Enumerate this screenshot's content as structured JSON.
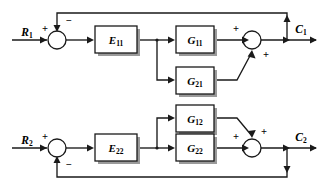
{
  "figure": {
    "type": "control-system-block-diagram",
    "background_color": "#ffffff",
    "line_color": "#1a1a1a",
    "block_fill": "#ffffff"
  },
  "inputs": [
    {
      "id": "r1",
      "base": "R",
      "sub": "1",
      "x": 27,
      "y": 33
    },
    {
      "id": "r2",
      "base": "R",
      "sub": "2",
      "x": 27,
      "y": 141
    }
  ],
  "outputs": [
    {
      "id": "c1",
      "base": "C",
      "sub": "1",
      "x": 301,
      "y": 30
    },
    {
      "id": "c2",
      "base": "C",
      "sub": "2",
      "x": 301,
      "y": 138
    }
  ],
  "blocks": [
    {
      "id": "e11",
      "base": "E",
      "sub": "11",
      "x": 95,
      "y": 26,
      "w": 42,
      "h": 27
    },
    {
      "id": "e22",
      "base": "E",
      "sub": "22",
      "x": 95,
      "y": 134,
      "w": 42,
      "h": 27
    },
    {
      "id": "g11",
      "base": "G",
      "sub": "11",
      "x": 176,
      "y": 26,
      "w": 38,
      "h": 27
    },
    {
      "id": "g21",
      "base": "G",
      "sub": "21",
      "x": 176,
      "y": 67,
      "w": 38,
      "h": 27
    },
    {
      "id": "g12",
      "base": "G",
      "sub": "12",
      "x": 176,
      "y": 105,
      "w": 38,
      "h": 27
    },
    {
      "id": "g22",
      "base": "G",
      "sub": "22",
      "x": 176,
      "y": 134,
      "w": 38,
      "h": 27
    }
  ],
  "summing_junctions": [
    {
      "id": "sum-r1",
      "cx": 57,
      "cy": 40,
      "r": 9,
      "signs": [
        {
          "label": "+",
          "x": 45,
          "y": 30,
          "port": "left"
        },
        {
          "label": "−",
          "x": 68,
          "y": 22,
          "port": "top"
        }
      ]
    },
    {
      "id": "sum-c1",
      "cx": 252,
      "cy": 40,
      "r": 9,
      "signs": [
        {
          "label": "+",
          "x": 236,
          "y": 30,
          "port": "left"
        },
        {
          "label": "+",
          "x": 265,
          "y": 56,
          "port": "bottom"
        }
      ]
    },
    {
      "id": "sum-r2",
      "cx": 57,
      "cy": 148,
      "r": 9,
      "signs": [
        {
          "label": "+",
          "x": 45,
          "y": 138,
          "port": "left"
        },
        {
          "label": "−",
          "x": 68,
          "y": 166,
          "port": "bottom"
        }
      ]
    },
    {
      "id": "sum-c2",
      "cx": 252,
      "cy": 148,
      "r": 9,
      "signs": [
        {
          "label": "+",
          "x": 236,
          "y": 138,
          "port": "left"
        },
        {
          "label": "+",
          "x": 263,
          "y": 133,
          "port": "top"
        }
      ]
    }
  ],
  "wires": {
    "r1_to_sum": "M 12,40 L 47,40",
    "sum_to_e11": "M 66,40 L 92,40",
    "e11_to_branch": "M 137,40 L 157,40",
    "branch_down": "M 157,40 L 157,80 L 173,80",
    "branch_to_g11": "M 157,40 L 173,40",
    "g11_to_sum": "M 214,40 L 249,40",
    "sum_to_c1": "M 261,40 L 316,40",
    "c1_feedback_up": "M 287,40 L 287,13 L 57,13 L 57,30",
    "r2_to_sum": "M 12,148 L 47,148",
    "sum_to_e22": "M 66,148 L 92,148",
    "e22_to_branch": "M 137,148 L 157,148",
    "branch_up_g12": "M 157,148 L 157,118 L 173,118",
    "branch_to_g22": "M 157,148 L 173,148",
    "g22_to_sum": "M 214,148 L 249,148",
    "sum_to_c2": "M 261,148 L 316,148",
    "c2_feedback_down": "M 287,148 L 287,177 L 57,177 L 57,158",
    "g21_cross": "M 214,80 L 237,80 L 252,52",
    "g12_cross": "M 214,118 L 237,118 L 252,136"
  },
  "junction_dots": [
    {
      "id": "tap-e11",
      "cx": 157,
      "cy": 40
    },
    {
      "id": "tap-e22",
      "cx": 157,
      "cy": 148
    }
  ],
  "arrowheads": [
    {
      "id": "arrow-r1-in",
      "x": 47,
      "y": 40,
      "dir": "right"
    },
    {
      "id": "arrow-e11-in",
      "x": 93,
      "y": 40,
      "dir": "right"
    },
    {
      "id": "arrow-g11-in",
      "x": 174,
      "y": 40,
      "dir": "right"
    },
    {
      "id": "arrow-g21-in",
      "x": 174,
      "y": 80,
      "dir": "right"
    },
    {
      "id": "arrow-sum-c1-in",
      "x": 249,
      "y": 40,
      "dir": "right"
    },
    {
      "id": "arrow-c1-out",
      "x": 287,
      "y": 40,
      "dir": "right"
    },
    {
      "id": "arrow-c1-end",
      "x": 316,
      "y": 40,
      "dir": "right"
    },
    {
      "id": "arrow-fb1-up",
      "x": 287,
      "y": 16,
      "dir": "up"
    },
    {
      "id": "arrow-fb1-down",
      "x": 57,
      "y": 31,
      "dir": "down"
    },
    {
      "id": "arrow-r2-in",
      "x": 47,
      "y": 148,
      "dir": "right"
    },
    {
      "id": "arrow-e22-in",
      "x": 93,
      "y": 148,
      "dir": "right"
    },
    {
      "id": "arrow-g12-in",
      "x": 174,
      "y": 118,
      "dir": "right"
    },
    {
      "id": "arrow-g22-in",
      "x": 174,
      "y": 148,
      "dir": "right"
    },
    {
      "id": "arrow-sum-c2-in",
      "x": 249,
      "y": 148,
      "dir": "right"
    },
    {
      "id": "arrow-c2-out",
      "x": 287,
      "y": 148,
      "dir": "right"
    },
    {
      "id": "arrow-c2-end",
      "x": 316,
      "y": 148,
      "dir": "right"
    },
    {
      "id": "arrow-fb2-down",
      "x": 287,
      "y": 172,
      "dir": "down"
    },
    {
      "id": "arrow-fb2-up",
      "x": 57,
      "y": 157,
      "dir": "up"
    },
    {
      "id": "arrow-cross-up",
      "x": 252,
      "y": 51,
      "dir": "up"
    },
    {
      "id": "arrow-cross-down",
      "x": 252,
      "y": 137,
      "dir": "down"
    }
  ]
}
